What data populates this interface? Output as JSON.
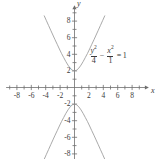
{
  "chart_data": {
    "type": "line",
    "title": "",
    "subtitle": "",
    "xlabel": "x",
    "ylabel": "y",
    "xlim": [
      -9.5,
      9.5
    ],
    "ylim": [
      -9.2,
      9.2
    ],
    "grid": false,
    "legend_position": "none",
    "x_ticks_major": [
      -8,
      -6,
      -4,
      -2,
      2,
      4,
      6,
      8
    ],
    "x_tick_labels": [
      "-8",
      "-6",
      "-4",
      "-2",
      "2",
      "4",
      "6",
      "8"
    ],
    "y_ticks_major": [
      8,
      6,
      4,
      2,
      -2,
      -4,
      -6,
      -8
    ],
    "y_tick_labels": [
      "8",
      "6",
      "4",
      "2",
      "-2",
      "-4",
      "-6",
      "-8"
    ],
    "x_ticks_minor": [
      -9,
      -7,
      -5,
      -3,
      -1,
      1,
      3,
      5,
      7,
      9
    ],
    "y_ticks_minor": [
      9,
      7,
      5,
      3,
      1,
      -1,
      -3,
      -5,
      -7,
      -9
    ],
    "annotations": [
      {
        "name": "hyperbola-equation",
        "latex": "y^2/4 - x^2/1 = 1",
        "numerator_1": "y",
        "numerator_1_exp": "2",
        "denominator_1": "4",
        "operator": "−",
        "numerator_2": "x",
        "numerator_2_exp": "2",
        "denominator_2": "1",
        "equals": "=",
        "right_side": "1",
        "x": 2.0,
        "y": 3.6
      }
    ],
    "series": [
      {
        "name": "upper-branch",
        "equation": "y = 2*sqrt(1 + x^2)",
        "color": "#9a9a9a",
        "vertex": [
          0,
          2
        ],
        "x": [
          -4.2,
          -3.9,
          -3.6,
          -3.3,
          -3.0,
          -2.7,
          -2.4,
          -2.1,
          -1.8,
          -1.5,
          -1.2,
          -0.9,
          -0.6,
          -0.3,
          0.0,
          0.3,
          0.6,
          0.9,
          1.2,
          1.5,
          1.8,
          2.1,
          2.4,
          2.7,
          3.0,
          3.3,
          3.6,
          3.9,
          4.2
        ],
        "values": [
          8.63,
          8.05,
          7.47,
          6.89,
          6.32,
          5.75,
          5.2,
          4.64,
          4.1,
          3.61,
          3.12,
          2.69,
          2.33,
          2.09,
          2.0,
          2.09,
          2.33,
          2.69,
          3.12,
          3.61,
          4.1,
          4.64,
          5.2,
          5.75,
          6.32,
          6.89,
          7.47,
          8.05,
          8.63
        ]
      },
      {
        "name": "lower-branch",
        "equation": "y = -2*sqrt(1 + x^2)",
        "color": "#9a9a9a",
        "vertex": [
          0,
          -2
        ],
        "x": [
          -4.2,
          -3.9,
          -3.6,
          -3.3,
          -3.0,
          -2.7,
          -2.4,
          -2.1,
          -1.8,
          -1.5,
          -1.2,
          -0.9,
          -0.6,
          -0.3,
          0.0,
          0.3,
          0.6,
          0.9,
          1.2,
          1.5,
          1.8,
          2.1,
          2.4,
          2.7,
          3.0,
          3.3,
          3.6,
          3.9,
          4.2
        ],
        "values": [
          -8.63,
          -8.05,
          -7.47,
          -6.89,
          -6.32,
          -5.75,
          -5.2,
          -4.64,
          -4.1,
          -3.61,
          -3.12,
          -2.69,
          -2.33,
          -2.09,
          -2.0,
          -2.09,
          -2.33,
          -2.69,
          -3.12,
          -3.61,
          -4.1,
          -4.64,
          -5.2,
          -5.75,
          -6.32,
          -6.89,
          -7.47,
          -8.05,
          -8.63
        ]
      }
    ],
    "axis_color": "#6e6e6e",
    "text_color": "#3a3a3a",
    "curve_color": "#9a9a9a",
    "background": "#ffffff"
  }
}
